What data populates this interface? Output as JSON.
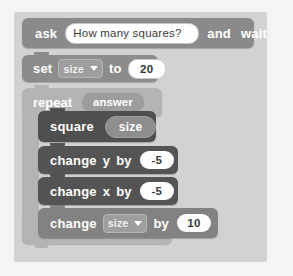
{
  "script": {
    "blocks": [
      {
        "id": "ask",
        "type": "sensing-stack",
        "label_1": "ask",
        "input_value": "How many squares?",
        "input_placeholder": "",
        "label_2": "and",
        "label_3": "wait"
      },
      {
        "id": "set",
        "type": "data-stack",
        "label_1": "set",
        "dropdown_value": "size",
        "label_2": "to",
        "number_value": "20"
      },
      {
        "id": "repeat",
        "type": "control-c",
        "label_1": "repeat",
        "reporter_value": "answer",
        "loop_arrow_icon": "loop-arrow-icon"
      },
      {
        "id": "square",
        "type": "custom-stack",
        "label_1": "square",
        "argument_value": "size"
      },
      {
        "id": "change-y",
        "type": "motion-stack",
        "label_1": "change",
        "label_2": "y",
        "label_3": "by",
        "number_value": "-5"
      },
      {
        "id": "change-x",
        "type": "motion-stack",
        "label_1": "change",
        "label_2": "x",
        "label_3": "by",
        "number_value": "-5"
      },
      {
        "id": "change-size",
        "type": "data-stack",
        "label_1": "change",
        "dropdown_value": "size",
        "label_2": "by",
        "number_value": "10"
      }
    ]
  },
  "colors": {
    "canvas": "#f4f4f4",
    "script_backdrop": "#d2d2d2",
    "sensing_block": "#8a8a8a",
    "data_block": "#8c8c8c",
    "control_block": "#b4b4b4",
    "custom_block": "#4f4f4f",
    "motion_block": "#545454",
    "input_field": "#ffffff",
    "text": "#ffffff"
  }
}
